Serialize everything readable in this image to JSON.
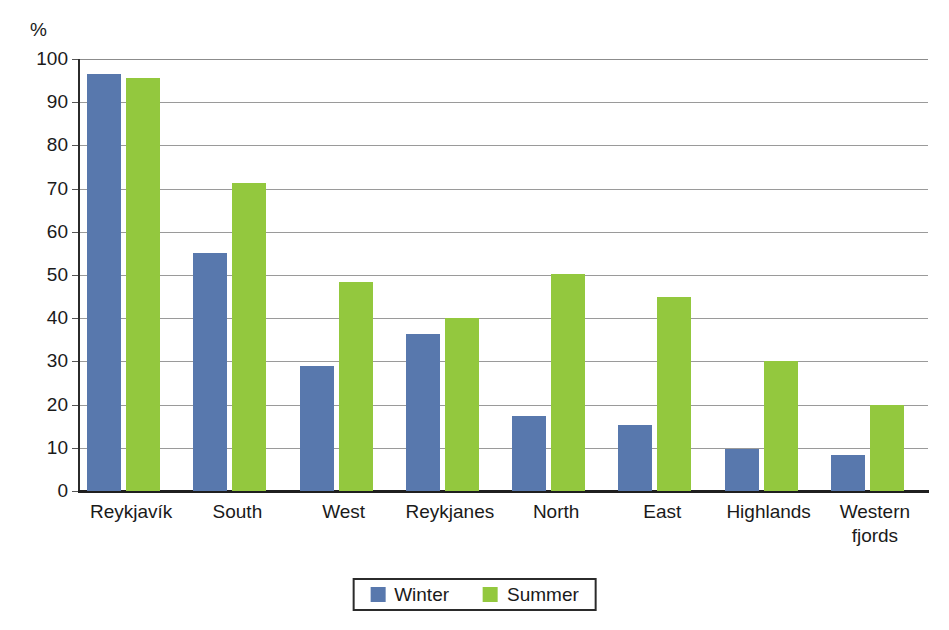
{
  "chart_data": {
    "type": "bar",
    "title": "",
    "subtitle": "",
    "xlabel": "",
    "ylabel": "%",
    "unit_label": "%",
    "ylim": [
      0,
      100
    ],
    "ytick_step": 10,
    "yticks": [
      "100",
      "90",
      "80",
      "70",
      "60",
      "50",
      "40",
      "30",
      "20",
      "10",
      "0"
    ],
    "grid": true,
    "grid_axis": "y",
    "legend_position": "bottom-center",
    "categories": [
      "Reykjavík",
      "South",
      "West",
      "Reykjanes",
      "North",
      "East",
      "Highlands",
      "Western\nfjords"
    ],
    "series": [
      {
        "name": "Winter",
        "color": "#5878ad",
        "values": [
          96.5,
          55.0,
          29.0,
          36.3,
          17.4,
          15.3,
          9.8,
          8.3
        ]
      },
      {
        "name": "Summer",
        "color": "#93c83e",
        "values": [
          95.5,
          71.3,
          48.4,
          40.0,
          50.2,
          44.8,
          30.0,
          20.0
        ]
      }
    ]
  },
  "legend": {
    "items": [
      {
        "label": "Winter",
        "color": "#5878ad"
      },
      {
        "label": "Summer",
        "color": "#93c83e"
      }
    ]
  },
  "colors": {
    "winter": "#5878ad",
    "summer": "#93c83e",
    "gridline": "#9a9a9a",
    "axis": "#1f1f1f",
    "text": "#1a1a1a",
    "background": "#ffffff"
  }
}
